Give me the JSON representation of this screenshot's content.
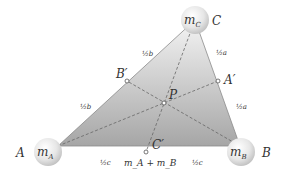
{
  "diagram": {
    "vertices": {
      "A": {
        "label": "A",
        "mass": "m_A",
        "x": 58,
        "y": 146
      },
      "B": {
        "label": "B",
        "mass": "m_B",
        "x": 240,
        "y": 146
      },
      "C": {
        "label": "C",
        "mass": "m_C",
        "x": 195,
        "y": 20
      }
    },
    "points": {
      "A_prime": {
        "label": "A′",
        "x": 218,
        "y": 81
      },
      "B_prime": {
        "label": "B′",
        "x": 127,
        "y": 81
      },
      "C_prime": {
        "label": "C′",
        "x": 146,
        "y": 152
      },
      "P": {
        "label": "P",
        "x": 164,
        "y": 103
      }
    },
    "segment_labels": {
      "AB_left": "½c",
      "AB_right": "½c",
      "AC_lower": "½b",
      "AC_upper": "½b",
      "BC_lower": "½a",
      "BC_upper": "½a"
    },
    "mass_labels": {
      "mA": "m",
      "mA_sub": "A",
      "mB": "m",
      "mB_sub": "B",
      "mC": "m",
      "mC_sub": "C",
      "sum": "m_A + m_B"
    },
    "colors": {
      "fill_top": "#f2f2f2",
      "fill_bottom": "#a8a8a8",
      "edge": "#888888",
      "dash": "#666666"
    }
  }
}
